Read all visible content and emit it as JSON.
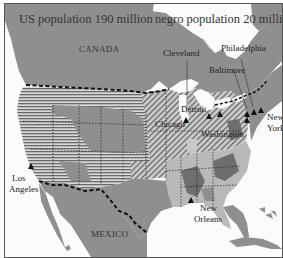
{
  "map": {
    "title_left": "US population 190 million",
    "title_right": "negro population 20 million",
    "countries": {
      "canada": "CANADA",
      "mexico": "MEXICO"
    },
    "cities": [
      {
        "name": "Cleveland"
      },
      {
        "name": "Philadelphia"
      },
      {
        "name": "Baltimore"
      },
      {
        "name": "Detroit"
      },
      {
        "name": "Chicago"
      },
      {
        "name": "Washington"
      },
      {
        "name": "New York"
      },
      {
        "name": "Los Angeles"
      },
      {
        "name": "New Orleans"
      }
    ],
    "labels": {
      "cleveland": "Cleveland",
      "philadelphia": "Philadelphia",
      "baltimore": "Baltimore",
      "detroit": "Detroit",
      "chicago": "Chicago",
      "washington": "Washington",
      "new_york_1": "New",
      "new_york_2": "York",
      "los_angeles_1": "Los",
      "los_angeles_2": "Angeles",
      "new_orleans_1": "New",
      "new_orleans_2": "Orleans"
    },
    "colors": {
      "land": "#8f8f8f",
      "land_light": "#b9b9b9",
      "land_dark": "#6e6e6e",
      "water": "#fbfbfb",
      "border": "#111111"
    }
  }
}
